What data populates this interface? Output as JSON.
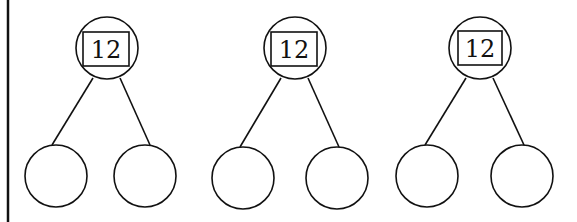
{
  "diagram": {
    "type": "number-bond",
    "bonds": [
      {
        "whole": "12",
        "parts": [
          "",
          ""
        ]
      },
      {
        "whole": "12",
        "parts": [
          "",
          ""
        ]
      },
      {
        "whole": "12",
        "parts": [
          "",
          ""
        ]
      }
    ]
  }
}
